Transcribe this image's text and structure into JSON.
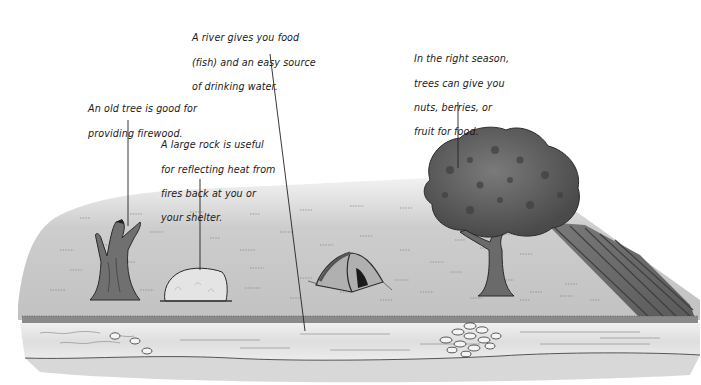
{
  "annotations": {
    "river": {
      "lines": [
        "A river gives you food",
        "(fish) and an easy source",
        "of drinking water."
      ]
    },
    "fruit_tree": {
      "lines": [
        "In the right season,",
        "trees can give you",
        "nuts, berries, or",
        "fruit for food."
      ]
    },
    "old_tree": {
      "lines": [
        "An old tree is good for",
        "providing firewood."
      ]
    },
    "rock": {
      "lines": [
        "A large rock is useful",
        "for reflecting heat from",
        "fires back at you or",
        "your shelter."
      ]
    }
  },
  "scene": {
    "elements": [
      "old-tree",
      "large-rock",
      "tent",
      "leafy-tree",
      "hill-slope",
      "river",
      "river-stones"
    ],
    "colors": {
      "ground": "#cfcfcf",
      "ground_dark": "#a8a8a8",
      "river": "#e6e6e6",
      "river_bank": "#8a8a8a",
      "tree_trunk": "#6e6e6e",
      "foliage": "#5e5e5e",
      "rock": "#e2e2e2",
      "tent": "#a9a9a9",
      "ink": "#222222"
    }
  }
}
